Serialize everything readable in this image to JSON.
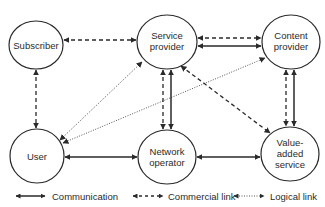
{
  "diagram": {
    "nodes": [
      {
        "id": "subscriber",
        "lines": [
          "Subscriber"
        ],
        "cx": 36,
        "cy": 45,
        "rx": 27,
        "ry": 24
      },
      {
        "id": "service-provider",
        "lines": [
          "Service",
          "provider"
        ],
        "cx": 167,
        "cy": 42,
        "rx": 30,
        "ry": 27
      },
      {
        "id": "content-provider",
        "lines": [
          "Content",
          "provider"
        ],
        "cx": 291,
        "cy": 42,
        "rx": 29,
        "ry": 27
      },
      {
        "id": "user",
        "lines": [
          "User"
        ],
        "cx": 37,
        "cy": 156,
        "rx": 27,
        "ry": 27
      },
      {
        "id": "network-operator",
        "lines": [
          "Network",
          "operator"
        ],
        "cx": 167,
        "cy": 157,
        "rx": 29,
        "ry": 27
      },
      {
        "id": "value-added-service",
        "lines": [
          "Value-",
          "added",
          "service"
        ],
        "cx": 290,
        "cy": 154,
        "rx": 29,
        "ry": 27
      }
    ],
    "edges": [
      {
        "from": "subscriber",
        "to": "service-provider",
        "type": "commercial",
        "bidirectional": true
      },
      {
        "from": "subscriber",
        "to": "user",
        "type": "commercial",
        "bidirectional": true
      },
      {
        "from": "service-provider",
        "to": "content-provider",
        "type": "commercial",
        "bidirectional": true
      },
      {
        "from": "service-provider",
        "to": "content-provider",
        "type": "communication",
        "bidirectional": true
      },
      {
        "from": "service-provider",
        "to": "network-operator",
        "type": "commercial",
        "bidirectional": true
      },
      {
        "from": "service-provider",
        "to": "network-operator",
        "type": "communication",
        "bidirectional": true
      },
      {
        "from": "service-provider",
        "to": "value-added-service",
        "type": "commercial",
        "bidirectional": true
      },
      {
        "from": "content-provider",
        "to": "value-added-service",
        "type": "commercial",
        "bidirectional": true
      },
      {
        "from": "content-provider",
        "to": "value-added-service",
        "type": "communication",
        "bidirectional": true
      },
      {
        "from": "user",
        "to": "service-provider",
        "type": "logical",
        "bidirectional": true
      },
      {
        "from": "user",
        "to": "content-provider",
        "type": "logical",
        "bidirectional": true
      },
      {
        "from": "user",
        "to": "network-operator",
        "type": "communication",
        "bidirectional": true
      },
      {
        "from": "network-operator",
        "to": "value-added-service",
        "type": "communication",
        "bidirectional": true
      }
    ]
  },
  "legend": {
    "items": [
      {
        "id": "communication",
        "label": "Communication",
        "style": "solid"
      },
      {
        "id": "commercial",
        "label": "Commercial link",
        "style": "dashed"
      },
      {
        "id": "logical",
        "label": "Logical link",
        "style": "dotted"
      }
    ]
  },
  "colors": {
    "stroke": "#2a2a2a",
    "background": "#ffffff"
  }
}
